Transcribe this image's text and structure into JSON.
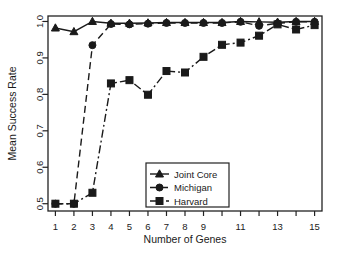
{
  "chart_data": {
    "type": "line",
    "title": "",
    "xlabel": "Number of Genes",
    "ylabel": "Mean Success Rate",
    "x": [
      1,
      2,
      3,
      4,
      5,
      6,
      7,
      8,
      9,
      10,
      11,
      12,
      13,
      14,
      15
    ],
    "xlim": [
      0.6,
      15.4
    ],
    "ylim": [
      0.48,
      1.015
    ],
    "xticks": [
      1,
      2,
      3,
      4,
      5,
      6,
      7,
      8,
      9,
      10,
      11,
      12,
      13,
      14,
      15
    ],
    "xtick_labels": [
      "1",
      "2",
      "3",
      "4",
      "5",
      "6",
      "7",
      "8",
      "9",
      "",
      "11",
      "",
      "13",
      "",
      "15"
    ],
    "yticks": [
      0.5,
      0.6,
      0.7,
      0.8,
      0.9,
      1.0
    ],
    "ytick_labels": [
      "0.5",
      "0.6",
      "0.7",
      "0.8",
      "0.9",
      "1.0"
    ],
    "grid": false,
    "legend_position": "bottom-center",
    "series": [
      {
        "name": "Joint Core",
        "marker": "triangle",
        "line_style": "solid",
        "color": "#1a1a1a",
        "values": [
          0.982,
          0.972,
          1.0,
          0.995,
          0.995,
          0.996,
          0.997,
          0.997,
          0.997,
          0.997,
          1.0,
          0.999,
          0.998,
          1.0,
          1.0
        ]
      },
      {
        "name": "Michigan",
        "marker": "circle",
        "line_style": "dashed",
        "color": "#1a1a1a",
        "values": [
          0.5,
          0.5,
          0.935,
          0.993,
          0.992,
          0.994,
          0.996,
          0.996,
          0.996,
          0.996,
          0.999,
          0.988,
          0.995,
          0.999,
          0.999
        ]
      },
      {
        "name": "Harvard",
        "marker": "square",
        "line_style": "dashdot",
        "color": "#1a1a1a",
        "values": [
          0.5,
          0.5,
          0.53,
          0.83,
          0.839,
          0.799,
          0.864,
          0.86,
          0.903,
          0.936,
          0.942,
          0.961,
          0.992,
          0.978,
          0.99
        ]
      }
    ]
  },
  "legend": {
    "entries": [
      {
        "label": "Joint Core"
      },
      {
        "label": "Michigan"
      },
      {
        "label": "Harvard"
      }
    ]
  }
}
